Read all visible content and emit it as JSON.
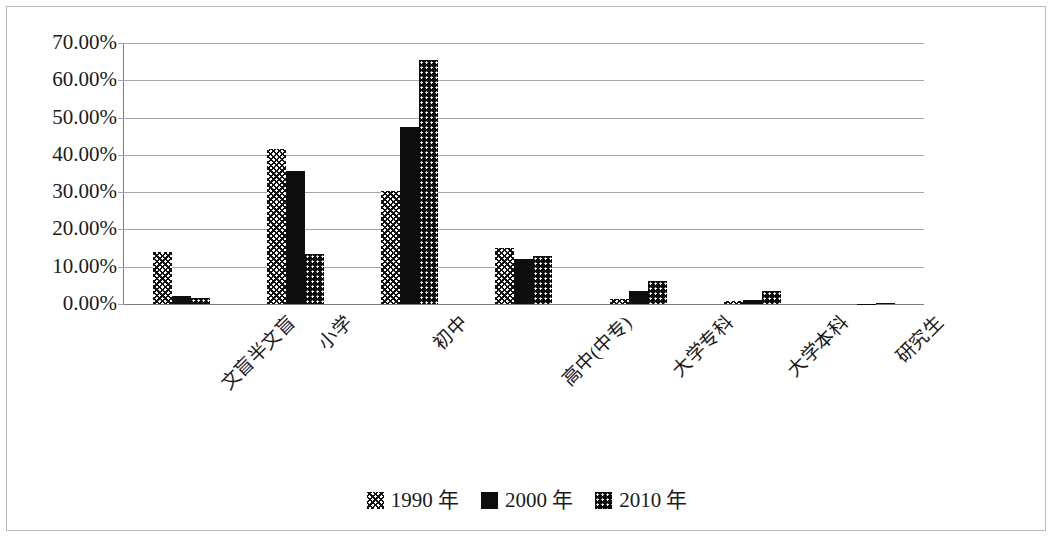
{
  "chart_data": {
    "type": "bar",
    "title": "",
    "subtitle": "",
    "xlabel": "",
    "ylabel": "",
    "grid": true,
    "legend_position": "bottom",
    "ylim": [
      0,
      70
    ],
    "ytick_labels": [
      "70.00%",
      "60.00%",
      "50.00%",
      "40.00%",
      "30.00%",
      "20.00%",
      "10.00%",
      "0.00%"
    ],
    "ytick_values": [
      70,
      60,
      50,
      40,
      30,
      20,
      10,
      0
    ],
    "categories": [
      "文盲半文盲",
      "小学",
      "初中",
      "高中(中专)",
      "大学专科",
      "大学本科",
      "研究生"
    ],
    "series": [
      {
        "name": "1990 年",
        "pattern": "cross-hatch",
        "color": "#111111",
        "values": [
          14.0,
          41.5,
          30.3,
          15.0,
          1.4,
          0.8,
          0.0
        ]
      },
      {
        "name": "2000 年",
        "pattern": "solid",
        "color": "#0d0d0d",
        "values": [
          2.2,
          35.7,
          47.5,
          12.2,
          3.6,
          1.2,
          0.1
        ]
      },
      {
        "name": "2010 年",
        "pattern": "dotted",
        "color": "#0d0d0d",
        "values": [
          1.6,
          13.3,
          65.5,
          13.0,
          6.2,
          3.6,
          0.3
        ]
      }
    ]
  },
  "legend": {
    "items": [
      {
        "label": "1990 年",
        "swatch": "cross-hatch-swatch"
      },
      {
        "label": "2000 年",
        "swatch": "solid-swatch"
      },
      {
        "label": "2010 年",
        "swatch": "dotted-swatch"
      }
    ]
  }
}
